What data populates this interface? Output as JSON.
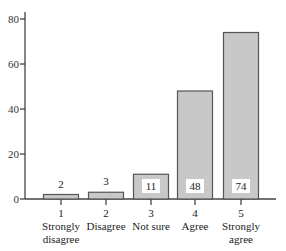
{
  "chart_data": {
    "type": "bar",
    "title": "",
    "xlabel": "",
    "ylabel": "",
    "ylim": [
      0,
      80
    ],
    "yticks": [
      0,
      20,
      40,
      60,
      80
    ],
    "grid": false,
    "legend": null,
    "categories": [
      {
        "code": "1",
        "label_lines": [
          "Strongly",
          "disagree"
        ]
      },
      {
        "code": "2",
        "label_lines": [
          "Disagree"
        ]
      },
      {
        "code": "3",
        "label_lines": [
          "Not sure"
        ]
      },
      {
        "code": "4",
        "label_lines": [
          "Agree"
        ]
      },
      {
        "code": "5",
        "label_lines": [
          "Strongly",
          "agree"
        ]
      }
    ],
    "category_names": [
      "1 Strongly disagree",
      "2 Disagree",
      "3 Not sure",
      "4 Agree",
      "5 Strongly agree"
    ],
    "values": [
      2,
      3,
      11,
      48,
      74
    ],
    "value_labels": [
      "2",
      "3",
      "11",
      "48",
      "74"
    ]
  },
  "style": {
    "bar_fill": "#c8c8c8",
    "bar_stroke": "#555555",
    "axis_color": "#444444",
    "label_box_fill": "#ffffff"
  }
}
